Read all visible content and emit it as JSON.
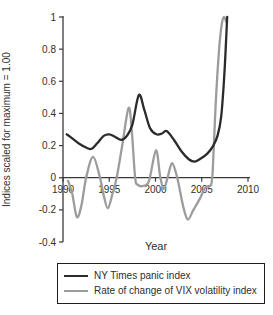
{
  "figure": {
    "background_color": "#ffffff"
  },
  "chart_data": {
    "type": "line",
    "title": "",
    "xlabel": "Year",
    "ylabel": "Indices scaled for maximum = 1.00",
    "xlim": [
      1990,
      2010
    ],
    "ylim": [
      -0.4,
      1
    ],
    "x_ticks": [
      1990,
      1995,
      2000,
      2005,
      2010
    ],
    "y_ticks": [
      1,
      0.8,
      0.6,
      0.4,
      0.2,
      0,
      -0.2,
      -0.4
    ],
    "y_tick_labels": [
      "1",
      "0.8",
      "0.6",
      "0.4",
      "0.2",
      "0",
      "-0.2",
      "-0.4"
    ],
    "grid": false,
    "legend_position": "bottom",
    "axis_color": "#3a3a3a",
    "series": [
      {
        "name": "NY Times panic index",
        "color": "#2b2b2b",
        "stroke_width": 2.3,
        "points": [
          [
            1990.4,
            0.27
          ],
          [
            1991.0,
            0.245
          ],
          [
            1991.8,
            0.21
          ],
          [
            1992.6,
            0.185
          ],
          [
            1993.1,
            0.18
          ],
          [
            1993.7,
            0.215
          ],
          [
            1994.4,
            0.26
          ],
          [
            1995.0,
            0.27
          ],
          [
            1995.6,
            0.255
          ],
          [
            1996.3,
            0.235
          ],
          [
            1996.9,
            0.26
          ],
          [
            1997.5,
            0.33
          ],
          [
            1998.2,
            0.515
          ],
          [
            1998.8,
            0.42
          ],
          [
            1999.4,
            0.31
          ],
          [
            2000.1,
            0.27
          ],
          [
            2000.7,
            0.275
          ],
          [
            2001.2,
            0.29
          ],
          [
            2002.0,
            0.235
          ],
          [
            2002.8,
            0.165
          ],
          [
            2003.6,
            0.115
          ],
          [
            2004.2,
            0.1
          ],
          [
            2004.9,
            0.12
          ],
          [
            2005.6,
            0.15
          ],
          [
            2006.2,
            0.195
          ],
          [
            2006.7,
            0.26
          ],
          [
            2007.1,
            0.38
          ],
          [
            2007.45,
            0.65
          ],
          [
            2007.75,
            1.0
          ]
        ]
      },
      {
        "name": "Rate of change of VIX volatility index",
        "color": "#9c9c9c",
        "stroke_width": 2.3,
        "points": [
          [
            1990.55,
            -0.02
          ],
          [
            1991.0,
            -0.1
          ],
          [
            1991.5,
            -0.245
          ],
          [
            1992.0,
            -0.17
          ],
          [
            1992.5,
            0.0
          ],
          [
            1993.25,
            0.13
          ],
          [
            1994.0,
            0.0
          ],
          [
            1994.4,
            -0.11
          ],
          [
            1994.85,
            -0.19
          ],
          [
            1995.35,
            -0.1
          ],
          [
            1995.8,
            0.0
          ],
          [
            1996.4,
            0.2
          ],
          [
            1997.1,
            0.435
          ],
          [
            1997.45,
            0.28
          ],
          [
            1997.8,
            0.0
          ],
          [
            1998.1,
            -0.045
          ],
          [
            1998.7,
            -0.05
          ],
          [
            1999.3,
            -0.02
          ],
          [
            2000.05,
            0.17
          ],
          [
            2000.5,
            0.01
          ],
          [
            2000.9,
            -0.07
          ],
          [
            2001.35,
            0.01
          ],
          [
            2001.8,
            0.09
          ],
          [
            2002.35,
            0.0
          ],
          [
            2003.0,
            -0.18
          ],
          [
            2003.5,
            -0.26
          ],
          [
            2004.1,
            -0.2
          ],
          [
            2004.8,
            -0.13
          ],
          [
            2005.4,
            -0.06
          ],
          [
            2006.0,
            -0.045
          ],
          [
            2006.2,
            0.06
          ],
          [
            2006.5,
            0.45
          ],
          [
            2006.85,
            0.78
          ],
          [
            2007.15,
            0.95
          ],
          [
            2007.4,
            1.0
          ],
          [
            2007.65,
            0.97
          ]
        ]
      }
    ]
  }
}
